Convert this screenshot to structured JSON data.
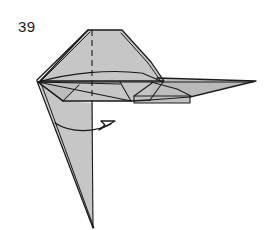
{
  "figure": {
    "kind": "origami-folding-diagram",
    "step_number": "39",
    "caption": "",
    "colors": {
      "paper_front": "#c6c6c6",
      "paper_front_light": "#d0d0d0",
      "paper_shadow": "#b4b4b4",
      "outline": "#1a1a1a",
      "crease_line": "#1a1a1a",
      "dashed_fold_line": "#1a1a1a",
      "arrow": "#1a1a1a",
      "background": "#ffffff",
      "step_number_color": "#1a1a1a"
    },
    "line_widths": {
      "outline": 1.3,
      "crease": 1.1,
      "dashed": 1.1,
      "arrow": 1.4
    },
    "dash_pattern": "6,4",
    "canvas": {
      "width": 266,
      "height": 230
    },
    "annotations": {
      "arrow_type": "valley-fold-rotate-arrow",
      "arrow_direction": "left-to-right",
      "dashed_line_name": "center-fold-line"
    },
    "shapes": {
      "body_top": "88,30 122,30 150,62 163,82 132,101 62,101 38,82",
      "left_lower_flap": "38,82 93,227 93,104 62,101",
      "tail_spike": "160,82 256,82 186,96 168,95",
      "creases": [
        "38,82 163,82",
        "38,82 130,70",
        "38,82 132,101",
        "38,82 118,93",
        "38,82 62,101",
        "92,70 92,101",
        "62,101 77,84",
        "122,30 150,62",
        "88,30 38,82",
        "150,62 163,82",
        "132,101 143,88",
        "163,82 132,101",
        "118,93 132,101"
      ]
    }
  }
}
